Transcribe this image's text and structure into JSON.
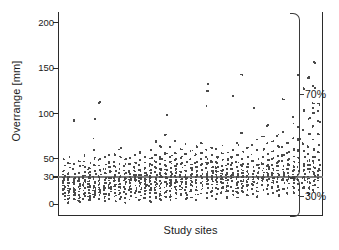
{
  "figure": {
    "background": "#ffffff",
    "marker_color": "#4a4a4a",
    "refline_color": "#7d7d7d",
    "axis_color": "#2b2b2b"
  },
  "annotations": {
    "upper_bracket_label": "70%",
    "lower_bracket_label": "30%"
  },
  "caption_fragment": "",
  "chart_data": {
    "type": "scatter",
    "title": "",
    "xlabel": "Study sites",
    "ylabel": "Overrange [mm]",
    "ylim": [
      -12,
      212
    ],
    "yticks": [
      0,
      30,
      50,
      100,
      150,
      200
    ],
    "ytick_labels": [
      "0",
      "30",
      "50",
      "100",
      "150",
      "200"
    ],
    "xticks": [],
    "xtick_labels": [],
    "grid": false,
    "legend": null,
    "reference_lines": [
      {
        "axis": "y",
        "value": 30,
        "label": "30 mm threshold",
        "color": "#7d7d7d"
      }
    ],
    "brackets": [
      {
        "label": "70%",
        "from": 30,
        "to": 212,
        "side": "right",
        "description": "share of measurements above the 30 mm line"
      },
      {
        "label": "30%",
        "from": -12,
        "to": 30,
        "side": "right",
        "description": "share of measurements at or below the 30 mm line"
      }
    ],
    "series": [
      {
        "name": "Overrange measurements",
        "marker": "dot",
        "color": "#4a4a4a",
        "sites": [
          {
            "site": 1,
            "values": [
              5,
              9,
              12,
              15,
              17,
              19,
              22,
              25,
              27,
              30,
              33,
              38,
              44,
              50
            ]
          },
          {
            "site": 2,
            "values": [
              3,
              7,
              11,
              14,
              16,
              18,
              21,
              24,
              27,
              29,
              31,
              35,
              41,
              46,
              52
            ]
          },
          {
            "site": 3,
            "values": [
              6,
              10,
              13,
              16,
              19,
              22,
              24,
              26,
              28,
              30,
              34,
              39,
              45,
              93
            ]
          },
          {
            "site": 4,
            "values": [
              4,
              8,
              12,
              15,
              18,
              20,
              23,
              26,
              29,
              31,
              36,
              42,
              48
            ]
          },
          {
            "site": 5,
            "values": [
              7,
              11,
              14,
              17,
              20,
              23,
              25,
              28,
              30,
              33,
              37,
              43,
              49,
              55
            ]
          },
          {
            "site": 6,
            "values": [
              5,
              9,
              13,
              16,
              19,
              21,
              24,
              27,
              29,
              32,
              36,
              40,
              47
            ]
          },
          {
            "site": 7,
            "values": [
              8,
              12,
              15,
              18,
              21,
              24,
              26,
              29,
              31,
              35,
              39,
              44,
              51,
              61,
              73,
              94
            ]
          },
          {
            "site": 8,
            "values": [
              6,
              10,
              14,
              17,
              20,
              22,
              25,
              28,
              30,
              33,
              38,
              43,
              50,
              114
            ]
          },
          {
            "site": 9,
            "values": [
              4,
              9,
              13,
              16,
              19,
              22,
              25,
              27,
              30,
              34,
              39,
              45,
              52
            ]
          },
          {
            "site": 10,
            "values": [
              7,
              11,
              15,
              18,
              21,
              23,
              26,
              29,
              31,
              36,
              41,
              47,
              54
            ]
          },
          {
            "site": 11,
            "values": [
              5,
              10,
              14,
              17,
              20,
              23,
              26,
              28,
              30,
              33,
              37,
              42,
              48,
              56
            ]
          },
          {
            "site": 12,
            "values": [
              8,
              12,
              16,
              19,
              22,
              24,
              27,
              30,
              32,
              36,
              40,
              46,
              53,
              62
            ]
          },
          {
            "site": 13,
            "values": [
              3,
              9,
              13,
              17,
              20,
              23,
              25,
              28,
              30,
              34,
              38,
              44,
              50
            ]
          },
          {
            "site": 14,
            "values": [
              6,
              11,
              15,
              18,
              21,
              24,
              27,
              29,
              31,
              35,
              39,
              45,
              52
            ]
          },
          {
            "site": 15,
            "values": [
              9,
              13,
              16,
              19,
              22,
              25,
              28,
              30,
              33,
              37,
              41,
              47,
              55
            ]
          },
          {
            "site": 16,
            "values": [
              5,
              10,
              14,
              18,
              21,
              24,
              26,
              29,
              31,
              34,
              38,
              43,
              49,
              58
            ]
          },
          {
            "site": 17,
            "values": [
              7,
              12,
              16,
              19,
              22,
              25,
              27,
              30,
              32,
              36,
              40,
              46,
              53
            ]
          },
          {
            "site": 18,
            "values": [
              4,
              9,
              14,
              17,
              20,
              23,
              26,
              29,
              31,
              35,
              39,
              44,
              51,
              60
            ]
          },
          {
            "site": 19,
            "values": [
              8,
              13,
              17,
              20,
              23,
              26,
              28,
              30,
              33,
              37,
              42,
              48,
              56,
              71
            ]
          },
          {
            "site": 20,
            "values": [
              6,
              11,
              15,
              18,
              21,
              24,
              27,
              30,
              32,
              35,
              40,
              45,
              52,
              65
            ]
          },
          {
            "site": 21,
            "values": [
              10,
              14,
              17,
              20,
              23,
              26,
              29,
              31,
              34,
              38,
              43,
              49,
              57,
              78,
              99
            ]
          },
          {
            "site": 22,
            "values": [
              5,
              10,
              15,
              19,
              22,
              25,
              27,
              30,
              33,
              36,
              41,
              47,
              54,
              63
            ]
          },
          {
            "site": 23,
            "values": [
              8,
              13,
              17,
              21,
              24,
              27,
              29,
              31,
              35,
              39,
              44,
              50,
              58,
              70
            ]
          },
          {
            "site": 24,
            "values": [
              12,
              16,
              19,
              22,
              25,
              28,
              30,
              33,
              36,
              41,
              46,
              53,
              62
            ]
          },
          {
            "site": 25,
            "values": [
              7,
              12,
              16,
              20,
              23,
              26,
              29,
              31,
              34,
              38,
              43,
              48,
              56,
              66
            ]
          },
          {
            "site": 26,
            "values": [
              9,
              14,
              18,
              21,
              24,
              27,
              30,
              32,
              35,
              40,
              45,
              51,
              59
            ]
          },
          {
            "site": 27,
            "values": [
              6,
              11,
              16,
              20,
              23,
              26,
              28,
              31,
              34,
              37,
              42,
              47,
              55,
              64
            ]
          },
          {
            "site": 28,
            "values": [
              13,
              17,
              21,
              24,
              27,
              30,
              32,
              35,
              39,
              44,
              50,
              57,
              68
            ]
          },
          {
            "site": 29,
            "values": [
              8,
              14,
              18,
              22,
              25,
              28,
              30,
              33,
              36,
              41,
              46,
              52,
              61,
              110,
              126,
              135
            ]
          },
          {
            "site": 30,
            "values": [
              10,
              15,
              19,
              23,
              26,
              29,
              31,
              34,
              38,
              42,
              48,
              55,
              63
            ]
          },
          {
            "site": 31,
            "values": [
              7,
              13,
              18,
              22,
              25,
              28,
              30,
              33,
              37,
              41,
              46,
              53,
              62
            ]
          },
          {
            "site": 32,
            "values": [
              14,
              19,
              23,
              26,
              29,
              31,
              34,
              38,
              43,
              49,
              57,
              66
            ]
          },
          {
            "site": 33,
            "values": [
              9,
              15,
              20,
              24,
              27,
              30,
              32,
              35,
              39,
              44,
              50,
              58
            ]
          },
          {
            "site": 34,
            "values": [
              11,
              16,
              21,
              25,
              28,
              30,
              33,
              36,
              40,
              45,
              52,
              61,
              121
            ]
          },
          {
            "site": 35,
            "values": [
              8,
              14,
              19,
              23,
              26,
              29,
              31,
              34,
              38,
              43,
              48,
              56,
              67
            ]
          },
          {
            "site": 36,
            "values": [
              15,
              20,
              24,
              27,
              30,
              32,
              35,
              39,
              44,
              50,
              59,
              79,
              143
            ]
          },
          {
            "site": 37,
            "values": [
              10,
              16,
              21,
              25,
              28,
              30,
              33,
              37,
              41,
              46,
              53,
              63
            ]
          },
          {
            "site": 38,
            "values": [
              12,
              18,
              22,
              26,
              29,
              31,
              34,
              38,
              42,
              48,
              55,
              65,
              107
            ]
          },
          {
            "site": 39,
            "values": [
              9,
              15,
              20,
              24,
              27,
              30,
              33,
              36,
              40,
              45,
              51,
              60,
              72
            ]
          },
          {
            "site": 40,
            "values": [
              17,
              22,
              26,
              29,
              31,
              34,
              37,
              41,
              46,
              52,
              61,
              75
            ]
          },
          {
            "site": 41,
            "values": [
              11,
              17,
              22,
              26,
              29,
              32,
              35,
              39,
              43,
              49,
              57,
              68,
              88
            ]
          },
          {
            "site": 42,
            "values": [
              13,
              19,
              24,
              27,
              30,
              33,
              36,
              40,
              45,
              51,
              59,
              71
            ]
          },
          {
            "site": 43,
            "values": [
              10,
              16,
              21,
              25,
              29,
              31,
              34,
              38,
              42,
              47,
              54,
              64,
              77
            ]
          },
          {
            "site": 44,
            "values": [
              18,
              23,
              27,
              30,
              33,
              36,
              39,
              43,
              48,
              55,
              64,
              80,
              117
            ]
          },
          {
            "site": 45,
            "values": [
              12,
              18,
              23,
              27,
              30,
              33,
              36,
              40,
              44,
              50,
              58,
              69
            ]
          },
          {
            "site": 46,
            "values": [
              14,
              20,
              25,
              28,
              31,
              34,
              38,
              42,
              47,
              53,
              62,
              74,
              90,
              98
            ]
          },
          {
            "site": 47,
            "values": [
              11,
              17,
              23,
              27,
              30,
              34,
              37,
              41,
              46,
              52,
              60,
              72,
              85,
              143
            ]
          },
          {
            "site": 48,
            "values": [
              19,
              24,
              28,
              31,
              35,
              38,
              42,
              46,
              52,
              59,
              68,
              83,
              104,
              129
            ]
          },
          {
            "site": 49,
            "values": [
              13,
              19,
              25,
              29,
              32,
              36,
              40,
              44,
              49,
              56,
              65,
              78,
              95,
              140
            ]
          },
          {
            "site": 50,
            "values": [
              16,
              22,
              27,
              31,
              34,
              38,
              42,
              47,
              53,
              61,
              71,
              86,
              102,
              108,
              112,
              130,
              157
            ]
          },
          {
            "site": 51,
            "values": [
              20,
              26,
              30,
              34,
              37,
              41,
              45,
              50,
              57,
              66,
              79,
              92,
              105,
              111
            ]
          }
        ]
      }
    ]
  }
}
